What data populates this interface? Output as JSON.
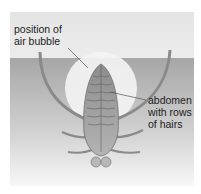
{
  "figure": {
    "labels": {
      "air_bubble": [
        "position of",
        "air bubble"
      ],
      "abdomen": [
        "abdomen",
        "with rows",
        "of hairs"
      ]
    },
    "colors": {
      "air": "#e8e8e8",
      "water_top": "#a8a8a8",
      "water_bottom": "#f2f2f2",
      "bubble": "#f4f4f4",
      "insect_body": "#9c9c9c",
      "insect_outline": "#6e6e6e",
      "leader_line": "#555555"
    }
  }
}
